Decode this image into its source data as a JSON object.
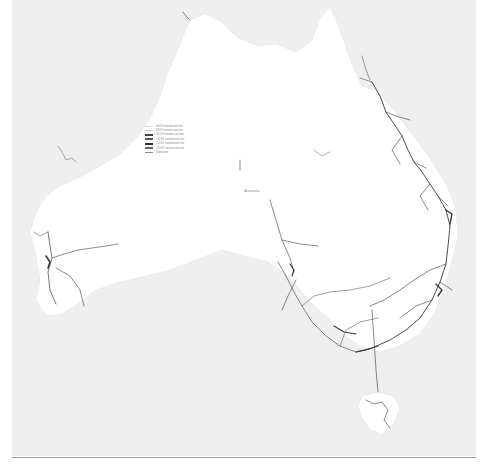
{
  "map": {
    "title": "Australia electricity transmission network",
    "country_label": "Australia",
    "colors": {
      "ocean": "#efefef",
      "land": "#ffffff",
      "lines": "#3a3a3a",
      "frame_rule": "#9a9a9a"
    },
    "legend": {
      "items": [
        {
          "label": "66 kV transmission line",
          "color": "#d8d8d8",
          "weight": 1
        },
        {
          "label": "88 kV transmission line",
          "color": "#c4c4c4",
          "weight": 1
        },
        {
          "label": "110 kV transmission line",
          "color": "#444444",
          "weight": 2
        },
        {
          "label": "132 kV transmission line",
          "color": "#555555",
          "weight": 2
        },
        {
          "label": "220 kV transmission line",
          "color": "#333333",
          "weight": 2
        },
        {
          "label": "275 kV transmission line",
          "color": "#666666",
          "weight": 1.5
        },
        {
          "label": "Substation",
          "color": "#888888",
          "weight": 1
        }
      ]
    },
    "places": [
      {
        "name": "Darwin",
        "x": 180,
        "y": 12
      },
      {
        "name": "Cairns",
        "x": 376,
        "y": 60
      },
      {
        "name": "Perth",
        "x": 28,
        "y": 258
      },
      {
        "name": "Adelaide",
        "x": 290,
        "y": 298
      },
      {
        "name": "Sydney",
        "x": 438,
        "y": 298
      },
      {
        "name": "Melbourne",
        "x": 356,
        "y": 344
      },
      {
        "name": "Brisbane",
        "x": 442,
        "y": 210
      },
      {
        "name": "Hobart",
        "x": 372,
        "y": 420
      }
    ]
  }
}
